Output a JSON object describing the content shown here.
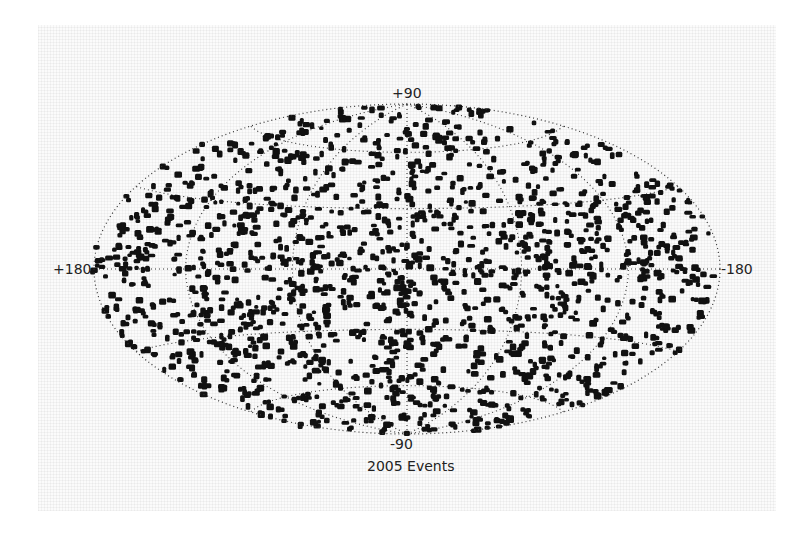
{
  "chart_data": {
    "type": "scatter",
    "projection": "hammer-aitoff (all-sky)",
    "title": "2005 Events",
    "xlabel": "",
    "ylabel": "",
    "axis_labels": {
      "top": "+90",
      "bottom": "-90",
      "left": "+180",
      "right": "-180"
    },
    "longitude_range": [
      180,
      -180
    ],
    "latitude_range": [
      -90,
      90
    ],
    "grid": {
      "on": true,
      "style": "dotted",
      "latitude_lines": [
        -60,
        -30,
        0,
        30,
        60
      ],
      "longitude_lines": [
        -120,
        -60,
        0,
        60,
        120
      ]
    },
    "series": [
      {
        "name": "Events",
        "marker": "filled square blobs",
        "color": "#111111",
        "distribution": "approximately isotropic over the full sky",
        "rendered_point_count": 1400,
        "seed": 2005
      }
    ],
    "legend": null
  },
  "colors": {
    "points": "#111111",
    "grid": "#333333",
    "background": "#ffffff"
  }
}
